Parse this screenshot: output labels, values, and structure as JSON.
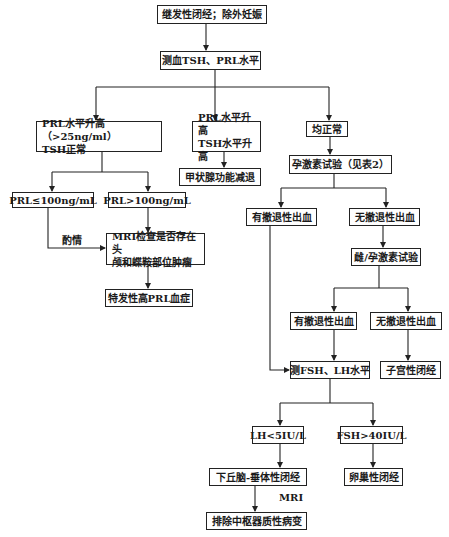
{
  "diagram": {
    "type": "flowchart",
    "nodes": {
      "n1": "继发性闭经；除外妊娠",
      "n2": "测血TSH、PRL水平",
      "n3": "PRL水平升高（>25ng/ml）\nTSH正常",
      "n4": "PRL水平升高\nTSH水平升高",
      "n5": "均正常",
      "n6": "甲状腺功能减退",
      "n7": "孕激素试验（见表2）",
      "n8": "PRL≤100ng/mL",
      "n9": "PRL>100ng/mL",
      "n10": "有撤退性出血",
      "n11": "无撤退性出血",
      "n12": "MRI检查是否存在头\n颅和蝶鞍部位肿瘤",
      "n13": "雌/孕激素试验",
      "n14": "特发性高PRL血症",
      "n15": "有撤退性出血",
      "n16": "无撤退性出血",
      "n17": "测FSH、LH水平",
      "n18": "子宫性闭经",
      "n19": "LH<5IU/L",
      "n20": "FSH>40IU/L",
      "n21": "下丘脑-垂体性闭经",
      "n22": "卵巢性闭经",
      "n23": "排除中枢器质性病变"
    },
    "edge_labels": {
      "as_needed": "酌情",
      "mri": "MRI"
    },
    "edges": [
      [
        "n1",
        "n2"
      ],
      [
        "n2",
        "n3"
      ],
      [
        "n2",
        "n4"
      ],
      [
        "n2",
        "n5"
      ],
      [
        "n4",
        "n6"
      ],
      [
        "n5",
        "n7"
      ],
      [
        "n3",
        "n8"
      ],
      [
        "n3",
        "n9"
      ],
      [
        "n7",
        "n10"
      ],
      [
        "n7",
        "n11"
      ],
      [
        "n8",
        "n12",
        "酌情"
      ],
      [
        "n9",
        "n12"
      ],
      [
        "n12",
        "n14"
      ],
      [
        "n11",
        "n13"
      ],
      [
        "n13",
        "n15"
      ],
      [
        "n13",
        "n16"
      ],
      [
        "n10",
        "n17"
      ],
      [
        "n15",
        "n17"
      ],
      [
        "n16",
        "n18"
      ],
      [
        "n17",
        "n19"
      ],
      [
        "n17",
        "n20"
      ],
      [
        "n19",
        "n21"
      ],
      [
        "n20",
        "n22"
      ],
      [
        "n21",
        "n23",
        "MRI"
      ]
    ]
  }
}
